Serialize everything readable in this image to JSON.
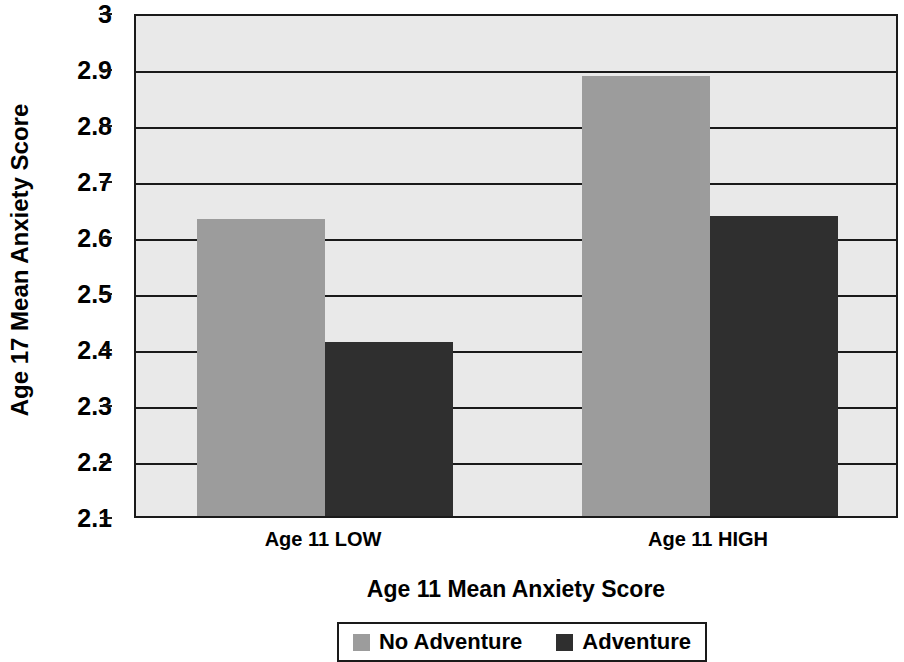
{
  "chart_data": {
    "type": "bar",
    "title": "",
    "xlabel": "Age 11 Mean Anxiety Score",
    "ylabel": "Age 17 Mean Anxiety Score",
    "categories": [
      "Age 11 LOW",
      "Age 11 HIGH"
    ],
    "series": [
      {
        "name": "No Adventure",
        "color": "#9c9c9c",
        "values": [
          2.63,
          2.885
        ]
      },
      {
        "name": "Adventure",
        "color": "#2f2f2f",
        "values": [
          2.41,
          2.635
        ]
      }
    ],
    "ylim": [
      2.1,
      3.0
    ],
    "ytick_labels": [
      "3",
      "2.9",
      "2.8",
      "2.7",
      "2.6",
      "2.5",
      "2.4",
      "2.3",
      "2.2",
      "2.1"
    ],
    "ytick_values": [
      3.0,
      2.9,
      2.8,
      2.7,
      2.6,
      2.5,
      2.4,
      2.3,
      2.2,
      2.1
    ],
    "grid": true,
    "legend_position": "bottom",
    "plot_background": "#e9e9e9",
    "axis_color": "#1a1a1a"
  },
  "legend": {
    "entries": [
      {
        "label": "No Adventure",
        "swatch": "light"
      },
      {
        "label": "Adventure",
        "swatch": "dark"
      }
    ]
  }
}
